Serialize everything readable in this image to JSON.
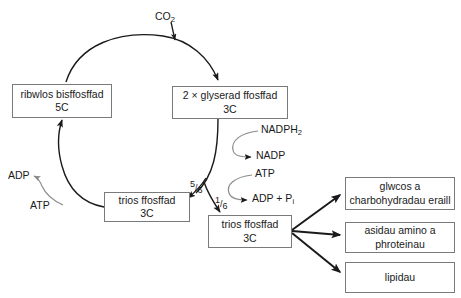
{
  "diagram": {
    "background": "#ffffff",
    "stroke_dark": "#1a1a1a",
    "stroke_gray": "#8c8c8c",
    "box_border": "#7a7a7a"
  },
  "nodes": {
    "ribwlos": {
      "line1": "ribwlos bisffosffad",
      "line2": "5C"
    },
    "glyserad": {
      "line1": "2 × glyserad ffosffad",
      "line2": "3C"
    },
    "trios_left": {
      "line1": "trios ffosffad",
      "line2": "3C"
    },
    "trios_right": {
      "line1": "trios ffosffad",
      "line2": "3C"
    },
    "glwcos": {
      "line1": "glwcos a",
      "line2": "charbohydradau eraill"
    },
    "asidau": {
      "line1": "asidau amino a",
      "line2": "phroteinau"
    },
    "lipidau": {
      "line1": "lipidau",
      "line2": ""
    }
  },
  "labels": {
    "co2": "CO",
    "co2_sub": "2",
    "nadph2": "NADPH",
    "nadph2_sub": "2",
    "nadp": "NADP",
    "atp_right": "ATP",
    "adp_pi": "ADP + P",
    "adp_pi_sub": "i",
    "adp_left": "ADP",
    "atp_left": "ATP"
  },
  "fractions": {
    "five_sixths_num": "5",
    "five_sixths_den": "6",
    "one_sixth_num": "1",
    "one_sixth_den": "6"
  }
}
